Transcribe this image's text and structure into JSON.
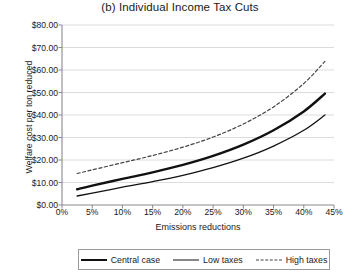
{
  "chart_data": {
    "type": "line",
    "title": "(b) Individual Income Tax Cuts",
    "xlabel": "Emissions reductions",
    "ylabel": "Welfare cost per ton reduced",
    "xlim": [
      0,
      45
    ],
    "ylim": [
      0,
      80
    ],
    "grid": true,
    "legend_position": "bottom",
    "xticks": [
      "0%",
      "5%",
      "10%",
      "15%",
      "20%",
      "25%",
      "30%",
      "35%",
      "40%",
      "45%"
    ],
    "xtick_values": [
      0,
      5,
      10,
      15,
      20,
      25,
      30,
      35,
      40,
      45
    ],
    "yticks": [
      "$0.00",
      "$10.00",
      "$20.00",
      "$30.00",
      "$40.00",
      "$50.00",
      "$60.00",
      "$70.00",
      "$80.00"
    ],
    "ytick_values": [
      0,
      10,
      20,
      30,
      40,
      50,
      60,
      70,
      80
    ],
    "x": [
      2.5,
      5,
      10,
      15,
      20,
      25,
      30,
      35,
      40,
      43.5
    ],
    "series": [
      {
        "name": "Central case",
        "style": "solid-thick",
        "color": "#111111",
        "values": [
          7.0,
          8.6,
          11.6,
          14.5,
          17.8,
          21.8,
          26.8,
          33.2,
          41.6,
          49.5
        ]
      },
      {
        "name": "Low taxes",
        "style": "solid-thin",
        "color": "#111111",
        "values": [
          4.0,
          5.3,
          7.9,
          10.4,
          13.2,
          16.6,
          20.8,
          26.2,
          33.2,
          40.0
        ]
      },
      {
        "name": "High taxes",
        "style": "dashed",
        "color": "#444444",
        "values": [
          14.0,
          15.6,
          18.8,
          22.0,
          25.7,
          30.2,
          36.0,
          43.6,
          54.0,
          63.8
        ]
      }
    ]
  }
}
